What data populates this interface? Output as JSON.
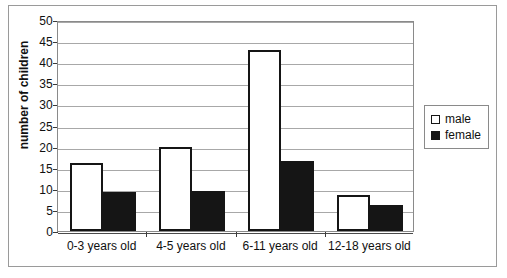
{
  "chart_data": {
    "type": "bar",
    "title": "",
    "subtitle": "",
    "xlabel": "",
    "ylabel": "number of children",
    "categories": [
      "0-3 years old",
      "4-5 years old",
      "6-11 years old",
      "12-18 years old"
    ],
    "series": [
      {
        "name": "male",
        "values": [
          16,
          20,
          43,
          8.5
        ],
        "color": "#ffffff",
        "edge_color": "#151515"
      },
      {
        "name": "female",
        "values": [
          9.2,
          9.4,
          16.5,
          6.2
        ],
        "color": "#151515",
        "edge_color": "#151515"
      }
    ],
    "ylim": [
      0,
      50
    ],
    "ytick_values": [
      0,
      5,
      10,
      15,
      20,
      25,
      30,
      35,
      40,
      45,
      50
    ],
    "ytick_labels": [
      "0",
      "5",
      "10",
      "15",
      "20",
      "25",
      "30",
      "35",
      "40",
      "45",
      "50"
    ],
    "grid": true,
    "grid_axis": "y",
    "legend": [
      "male",
      "female"
    ],
    "legend_position": "right-outside",
    "frame": true
  },
  "legend": {
    "items": [
      {
        "label": "male",
        "swatch": "hollow-square"
      },
      {
        "label": "female",
        "swatch": "filled-square"
      }
    ]
  }
}
